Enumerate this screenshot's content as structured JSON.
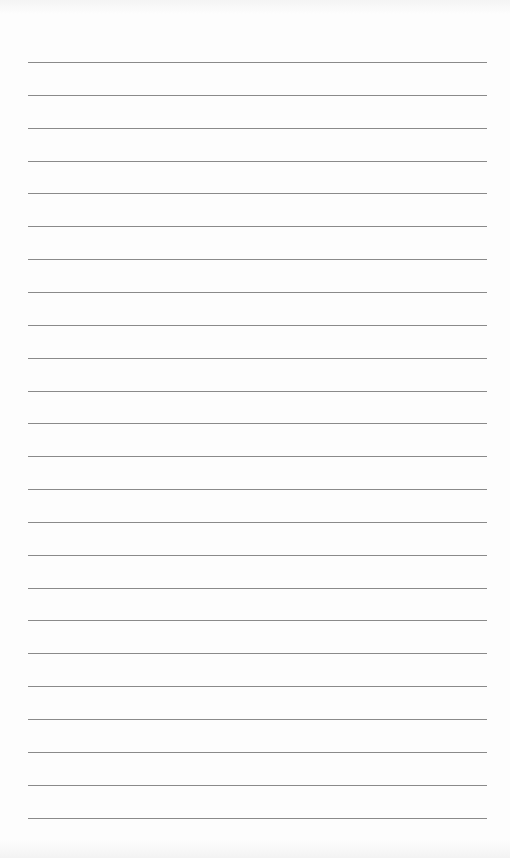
{
  "page": {
    "type": "lined-paper",
    "line_count": 24,
    "first_line_y": 62,
    "line_spacing": 32.85,
    "line_left": 28,
    "line_width": 459,
    "line_color": "#8a8a8a",
    "paper_color": "#fdfdfd"
  }
}
